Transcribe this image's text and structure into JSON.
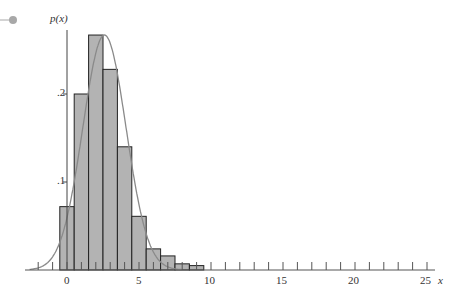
{
  "chart_data": {
    "type": "bar",
    "title": "",
    "xlabel": "x",
    "ylabel": "p(x)",
    "categories": [
      0,
      1,
      2,
      3,
      4,
      5,
      6,
      7,
      8,
      9
    ],
    "values": [
      0.072,
      0.2,
      0.267,
      0.228,
      0.14,
      0.061,
      0.024,
      0.016,
      0.007,
      0.005
    ],
    "overlay_curve": {
      "type": "normal",
      "mean": 2.6,
      "sd": 1.5,
      "peak": 0.267
    },
    "xticks": [
      0,
      5,
      10,
      15,
      20,
      25
    ],
    "yticks": [
      ".1",
      ".2"
    ],
    "xlim": [
      -3,
      26
    ],
    "ylim": [
      0,
      0.27
    ],
    "grid": false
  },
  "axis": {
    "y_label": "p(x)",
    "x_label": "x",
    "x_tick_labels": [
      "0",
      "5",
      "10",
      "15",
      "20",
      "25"
    ],
    "y_tick_labels": [
      ".1",
      ".2"
    ]
  },
  "colors": {
    "bar_fill": "#b3b3b3",
    "bar_stroke": "#222222",
    "curve": "#8a8a8a",
    "bullet": "#a8a8a8"
  }
}
